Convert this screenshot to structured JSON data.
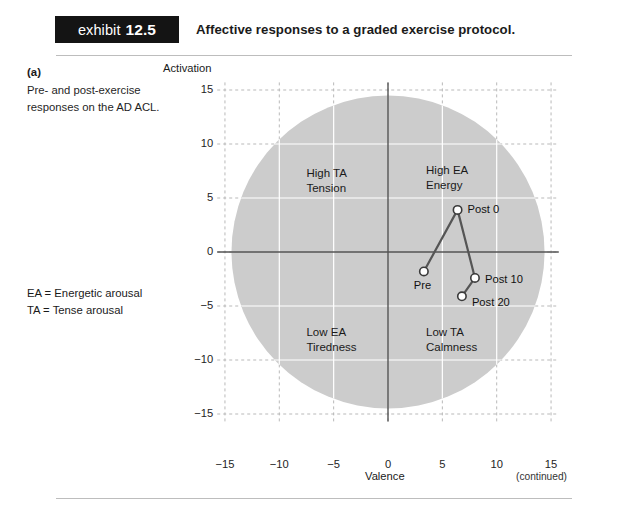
{
  "header": {
    "badge_word": "exhibit",
    "badge_number": "12.5",
    "title": "Affective responses to a graded exercise protocol."
  },
  "caption": {
    "part_label": "(a)",
    "text": "Pre- and post-exercise responses on the AD ACL.",
    "legend_ea": "EA = Energetic arousal",
    "legend_ta": "TA = Tense arousal"
  },
  "footer": {
    "continued": "(continued)"
  },
  "chart_data": {
    "type": "scatter",
    "title": "Affective responses to a graded exercise protocol.",
    "xlabel": "Valence",
    "ylabel": "Activation",
    "xlim": [
      -17,
      17
    ],
    "ylim": [
      -17,
      17
    ],
    "xticks": [
      "-15",
      "-10",
      "-5",
      "0",
      "5",
      "10",
      "15"
    ],
    "xtick_values": [
      -15,
      -10,
      -5,
      0,
      5,
      10,
      15
    ],
    "yticks": [
      "15",
      "10",
      "5",
      "0",
      "-5",
      "-10",
      "-15"
    ],
    "ytick_values": [
      15,
      10,
      5,
      0,
      -5,
      -10,
      -15
    ],
    "grid": true,
    "legend_position": "none",
    "background_shape": {
      "type": "circle",
      "center": [
        0,
        0
      ],
      "radius": 14.4,
      "fill": "#cccccc"
    },
    "quadrant_labels": [
      {
        "id": "high-ta",
        "line1": "High TA",
        "line2": "Tension",
        "x": -7.5,
        "y": 7.2
      },
      {
        "id": "high-ea",
        "line1": "High EA",
        "line2": "Energy",
        "x": 3.5,
        "y": 7.5
      },
      {
        "id": "low-ea",
        "line1": "Low EA",
        "line2": "Tiredness",
        "x": -7.5,
        "y": -7.5
      },
      {
        "id": "low-ta",
        "line1": "Low TA",
        "line2": "Calmness",
        "x": 3.5,
        "y": -7.5
      }
    ],
    "series": [
      {
        "name": "AD ACL responses",
        "marker": "open-circle",
        "line_color": "#555555",
        "points": [
          {
            "label": "Pre",
            "x": 3.3,
            "y": -1.8
          },
          {
            "label": "Post 0",
            "x": 6.4,
            "y": 3.9
          },
          {
            "label": "Post 10",
            "x": 8.0,
            "y": -2.4
          },
          {
            "label": "Post 20",
            "x": 6.8,
            "y": -4.1
          }
        ],
        "path_order": [
          "Pre",
          "Post 0",
          "Post 10",
          "Post 20"
        ]
      }
    ]
  },
  "colors": {
    "badge_bg": "#141414",
    "circle_fill": "#cccccc",
    "grid": "#b9b9b9",
    "axis": "#555555",
    "rule": "#bdbdbd"
  }
}
